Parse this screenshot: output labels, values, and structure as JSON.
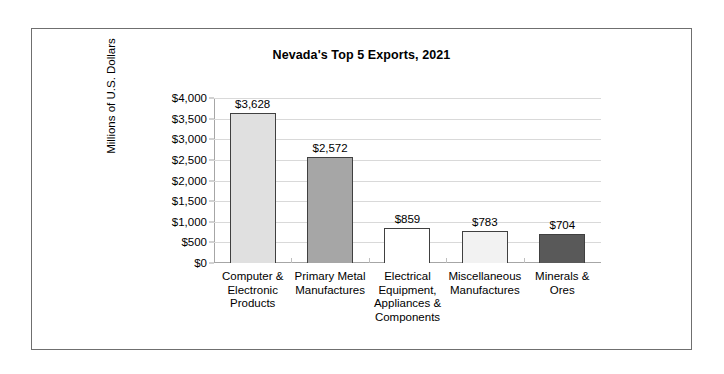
{
  "chart_data": {
    "type": "bar",
    "title": "Nevada's Top 5 Exports, 2021",
    "xlabel": "",
    "ylabel": "Millions of U.S. Dollars",
    "ylim": [
      0,
      4000
    ],
    "ytick_step": 500,
    "grid": true,
    "legend": false,
    "categories": [
      "Computer & Electronic Products",
      "Primary Metal Manufactures",
      "Electrical Equipment, Appliances & Components",
      "Miscellaneous Manufactures",
      "Minerals & Ores"
    ],
    "values": [
      3628,
      2572,
      859,
      783,
      704
    ],
    "data_labels": [
      "$3,628",
      "$2,572",
      "$859",
      "$783",
      "$704"
    ],
    "ytick_labels": [
      "$4,000",
      "$3,500",
      "$3,000",
      "$2,500",
      "$2,000",
      "$1,500",
      "$1,000",
      "$500",
      "$0"
    ],
    "ytick_values": [
      4000,
      3500,
      3000,
      2500,
      2000,
      1500,
      1000,
      500,
      0
    ],
    "bar_colors": [
      "#e0e0e0",
      "#a6a6a6",
      "#ffffff",
      "#f2f2f2",
      "#595959"
    ],
    "bar_border_color": "#404040",
    "gridline_color": "#d9d9d9",
    "axis_color": "#a6a6a6",
    "frame_color": "#6f6f6f",
    "background": "#ffffff"
  },
  "category_lines": [
    [
      "Computer &",
      "Electronic",
      "Products"
    ],
    [
      "Primary Metal",
      "Manufactures"
    ],
    [
      "Electrical",
      "Equipment,",
      "Appliances &",
      "Components"
    ],
    [
      "Miscellaneous",
      "Manufactures"
    ],
    [
      "Minerals &",
      "Ores"
    ]
  ]
}
